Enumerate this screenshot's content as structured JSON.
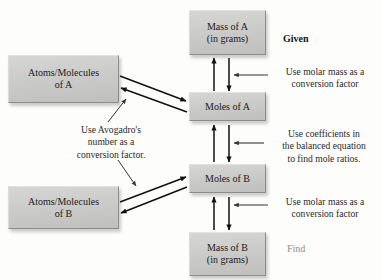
{
  "diagram": {
    "colors": {
      "box_fill": "#c9c9c7",
      "box_border": "#8d8d8b",
      "arrow": "#111111",
      "text": "#1b1b1b",
      "find_label": "#8e8e8e",
      "background": "#fdfdfc"
    },
    "boxes": [
      {
        "id": "mass-a",
        "label": "Mass of A\n(in grams)"
      },
      {
        "id": "atoms-a",
        "label": "Atoms/Molecules\nof A"
      },
      {
        "id": "moles-a",
        "label": "Moles of A"
      },
      {
        "id": "moles-b",
        "label": "Moles of B"
      },
      {
        "id": "atoms-b",
        "label": "Atoms/Molecules\nof B"
      },
      {
        "id": "mass-b",
        "label": "Mass of B\n(in grams)"
      }
    ],
    "annotations": [
      {
        "id": "molar-mass-top",
        "text": "Use molar mass as a\nconversion factor"
      },
      {
        "id": "coefficients",
        "text": "Use coefficients in\nthe balanced equation\nto find mole ratios."
      },
      {
        "id": "avogadro",
        "text": "Use Avogadro's\nnumber as a\nconversion factor."
      },
      {
        "id": "molar-mass-bottom",
        "text": "Use molar mass as a\nconversion factor"
      }
    ],
    "tags": {
      "given": "Given",
      "find": "Find"
    }
  }
}
